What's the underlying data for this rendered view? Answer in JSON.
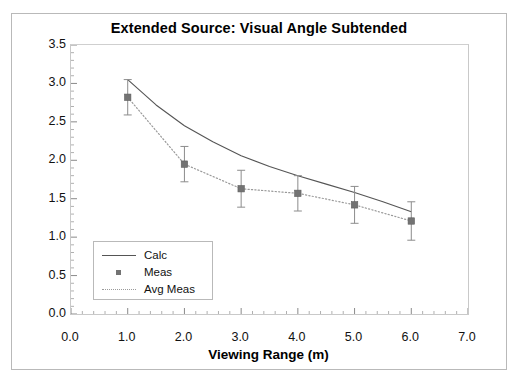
{
  "figure": {
    "top_strip_text": "",
    "background": "#ffffff",
    "frame_color": "#b9b9b9"
  },
  "chart_data": {
    "type": "line",
    "title": "Extended Source:  Visual Angle Subtended",
    "xlabel": "Viewing Range (m)",
    "ylabel": "Angle Subtended (mrad)",
    "xlim": [
      0.0,
      7.0
    ],
    "ylim": [
      0.0,
      3.5
    ],
    "xticks": [
      "0.0",
      "1.0",
      "2.0",
      "3.0",
      "4.0",
      "5.0",
      "6.0",
      "7.0"
    ],
    "yticks": [
      "0.0",
      "0.5",
      "1.0",
      "1.5",
      "2.0",
      "2.5",
      "3.0",
      "3.5"
    ],
    "xtick_values": [
      0.0,
      1.0,
      2.0,
      3.0,
      4.0,
      5.0,
      6.0,
      7.0
    ],
    "ytick_values": [
      0.0,
      0.5,
      1.0,
      1.5,
      2.0,
      2.5,
      3.0,
      3.5
    ],
    "x_minor_step": 0.2,
    "y_minor_step": 0.1,
    "grid": false,
    "legend_position": "lower left",
    "series": [
      {
        "name": "Calc",
        "style": "solid-line",
        "color": "#555555",
        "x": [
          1.0,
          1.5,
          2.0,
          2.5,
          3.0,
          3.5,
          4.0,
          4.5,
          5.0,
          5.5,
          6.0
        ],
        "values": [
          3.05,
          2.72,
          2.45,
          2.24,
          2.06,
          1.92,
          1.8,
          1.69,
          1.58,
          1.46,
          1.33
        ]
      },
      {
        "name": "Meas",
        "style": "square-markers-with-error-bars",
        "color": "#737373",
        "x": [
          1.0,
          2.0,
          3.0,
          4.0,
          5.0,
          6.0
        ],
        "values": [
          2.82,
          1.95,
          1.63,
          1.57,
          1.42,
          1.21
        ],
        "error_upper": [
          0.23,
          0.23,
          0.24,
          0.23,
          0.24,
          0.25
        ],
        "error_lower": [
          0.23,
          0.23,
          0.24,
          0.23,
          0.24,
          0.25
        ]
      },
      {
        "name": "Avg Meas",
        "style": "dotted-line",
        "color": "#9a9a9a",
        "x": [
          1.0,
          2.0,
          3.0,
          4.0,
          5.0,
          6.0
        ],
        "values": [
          2.82,
          1.95,
          1.63,
          1.57,
          1.42,
          1.21
        ]
      }
    ]
  },
  "legend": {
    "entries": [
      {
        "label": "Calc",
        "key": "solid-line"
      },
      {
        "label": "Meas",
        "key": "square-marker"
      },
      {
        "label": "Avg Meas",
        "key": "dotted-line"
      }
    ]
  }
}
